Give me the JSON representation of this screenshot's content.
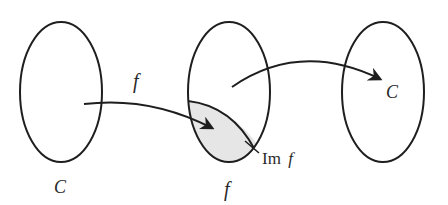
{
  "diagram": {
    "title": "",
    "colors": {
      "stroke": "#1e1e1e",
      "shade": "#e6e6e6",
      "background": "#ffffff",
      "text": "#2a2a2a"
    },
    "sets": [
      {
        "id": "left",
        "label": "C",
        "cx": 61,
        "cy": 92,
        "rx": 41,
        "ry": 70
      },
      {
        "id": "middle",
        "label": "f",
        "cx": 229,
        "cy": 92,
        "rx": 41,
        "ry": 70
      },
      {
        "id": "right",
        "label": "C",
        "cx": 383,
        "cy": 92,
        "rx": 41,
        "ry": 70
      }
    ],
    "arrows": [
      {
        "id": "arrow-left-to-middle",
        "label": "f",
        "from": "left",
        "to": "middle (shaded region)"
      },
      {
        "id": "arrow-middle-to-right",
        "label": "",
        "from": "middle",
        "to": "right"
      }
    ],
    "regions": [
      {
        "id": "image-region",
        "label": "Im f",
        "label_main": "Im",
        "label_var": "f",
        "in_set": "middle",
        "shaded": true
      }
    ],
    "labels": {
      "arrow_f": "f",
      "left_set": "C",
      "middle_set": "f",
      "right_inner": "C",
      "im_main": "Im",
      "im_var": "f"
    }
  }
}
